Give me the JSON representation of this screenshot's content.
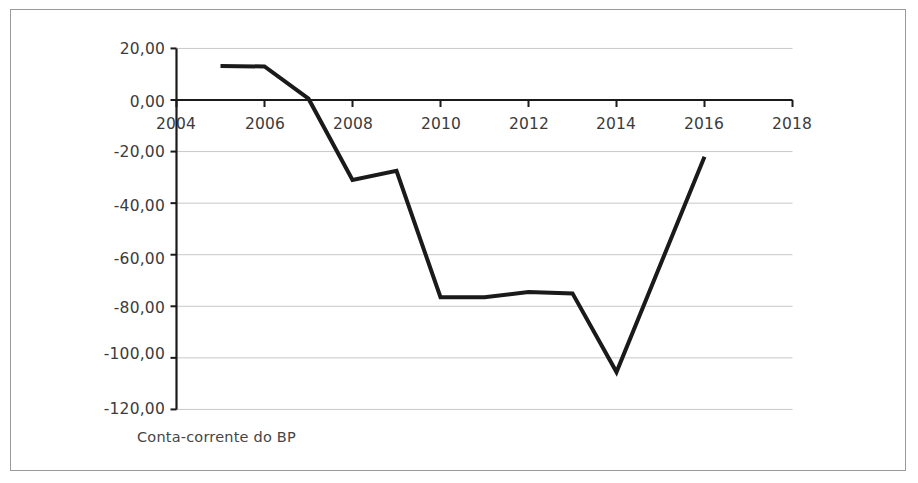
{
  "chart_data": {
    "type": "line",
    "title": "",
    "subtitle": "",
    "xlabel": "",
    "ylabel": "",
    "legend": [
      "Conta-corrente do BP"
    ],
    "legend_position": "below-axis-left",
    "grid": "horizontal",
    "xlim": [
      2004,
      2018
    ],
    "ylim": [
      -120,
      20
    ],
    "xticks": [
      "2004",
      "2006",
      "2008",
      "2010",
      "2012",
      "2014",
      "2016",
      "2018"
    ],
    "xtick_values": [
      2004,
      2006,
      2008,
      2010,
      2012,
      2014,
      2016,
      2018
    ],
    "yticks": [
      "20,00",
      "0,00",
      "-20,00",
      "-40,00",
      "-60,00",
      "-80,00",
      "-100,00",
      "-120,00"
    ],
    "ytick_values": [
      20,
      0,
      -20,
      -40,
      -60,
      -80,
      -100,
      -120
    ],
    "series": [
      {
        "name": "Conta-corrente do BP",
        "color": "#1a1a1a",
        "line_width": 4,
        "x": [
          2005,
          2006,
          2007,
          2008,
          2009,
          2010,
          2011,
          2012,
          2013,
          2014,
          2016
        ],
        "values": [
          13.2,
          13.0,
          0.5,
          -31.0,
          -27.5,
          -76.5,
          -76.5,
          -74.5,
          -75.0,
          -105.5,
          -22.0
        ]
      }
    ]
  },
  "axes": {
    "zero_line_color": "#1a1a1a",
    "grid_color": "#c8c8c8",
    "axis_color": "#1a1a1a",
    "tick_label_color": "#3b3b3b"
  },
  "frame": {
    "border_color": "#9a9a9a",
    "background": "#ffffff"
  },
  "legend_text": "Conta-corrente do BP"
}
